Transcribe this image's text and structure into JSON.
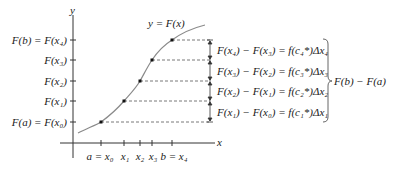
{
  "diagram": {
    "axes": {
      "y_label": "y",
      "x_label": "x"
    },
    "curve_label": "y = F(x)",
    "y_ticks": [
      {
        "label": "F(b) = F(x₄)",
        "y": 40
      },
      {
        "label": "F(x₃)",
        "y": 60
      },
      {
        "label": "F(x₂)",
        "y": 81
      },
      {
        "label": "F(x₁)",
        "y": 101
      },
      {
        "label": "F(a) = F(x₀)",
        "y": 122
      }
    ],
    "x_ticks": [
      {
        "label": "a = x₀",
        "x": 101
      },
      {
        "label": "x₁",
        "x": 124
      },
      {
        "label": "x₂",
        "x": 140
      },
      {
        "label": "x₃",
        "x": 152
      },
      {
        "label": "b = x₄",
        "x": 172
      }
    ],
    "points": [
      {
        "x": 101,
        "y": 122
      },
      {
        "x": 124,
        "y": 101
      },
      {
        "x": 140,
        "y": 81
      },
      {
        "x": 152,
        "y": 60
      },
      {
        "x": 172,
        "y": 40
      }
    ],
    "differences": [
      "F(x₄) − F(x₃) = f(c₄*)Δx₄",
      "F(x₃) − F(x₂) = f(c₃*)Δx₃",
      "F(x₂) − F(x₁) = f(c₂*)Δx₂",
      "F(x₁) − F(x₀) = f(c₁*)Δx₁"
    ],
    "brace_label": "F(b) − F(a)",
    "colors": {
      "curve": "#8a8a8a",
      "axis": "#333333",
      "text": "#1a1a1a",
      "dashed": "#555555"
    }
  }
}
